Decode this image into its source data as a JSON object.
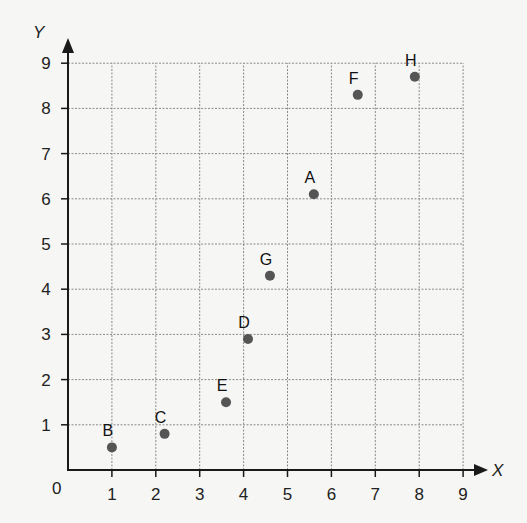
{
  "chart_data": {
    "type": "scatter",
    "title": "",
    "xlabel": "X",
    "ylabel": "Y",
    "xlim": [
      0,
      9
    ],
    "ylim": [
      0,
      9
    ],
    "grid": true,
    "origin_label": "0",
    "x_ticks": [
      "1",
      "2",
      "3",
      "4",
      "5",
      "6",
      "7",
      "8",
      "9"
    ],
    "y_ticks": [
      "1",
      "2",
      "3",
      "4",
      "5",
      "6",
      "7",
      "8",
      "9"
    ],
    "points": [
      {
        "label": "A",
        "x": 5.6,
        "y": 6.1
      },
      {
        "label": "B",
        "x": 1.0,
        "y": 0.5
      },
      {
        "label": "C",
        "x": 2.2,
        "y": 0.8
      },
      {
        "label": "D",
        "x": 4.1,
        "y": 2.9
      },
      {
        "label": "E",
        "x": 3.6,
        "y": 1.5
      },
      {
        "label": "F",
        "x": 6.6,
        "y": 8.3
      },
      {
        "label": "G",
        "x": 4.6,
        "y": 4.3
      },
      {
        "label": "H",
        "x": 7.9,
        "y": 8.7
      }
    ],
    "colors": {
      "point": "#555555",
      "axis": "#1a1a1a",
      "grid": "#8a8a8a",
      "background": "#f6f6f4"
    }
  }
}
